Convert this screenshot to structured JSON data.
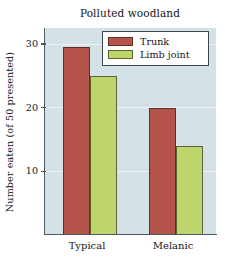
{
  "chart_data": {
    "type": "bar",
    "title": "Polluted woodland",
    "xlabel": "",
    "ylabel": "Number eaten (of 50 presented)",
    "categories": [
      "Typical",
      "Melanic"
    ],
    "series": [
      {
        "name": "Trunk",
        "color": "#b4544a",
        "values": [
          29.5,
          20
        ]
      },
      {
        "name": "Limb joint",
        "color": "#bdd56b",
        "values": [
          25,
          14
        ]
      }
    ],
    "ylim": [
      0,
      32.5
    ],
    "yticks": [
      10,
      20,
      30
    ],
    "ytick_labels": [
      "10",
      "20",
      "30"
    ],
    "grid": true,
    "legend_position": "top-right-inside",
    "plot_background": "#d4e2e8",
    "axis_color": "#4c5a62"
  },
  "legend": {
    "items": [
      {
        "label": "Trunk",
        "color": "#b4544a"
      },
      {
        "label": "Limb joint",
        "color": "#bdd56b"
      }
    ]
  }
}
